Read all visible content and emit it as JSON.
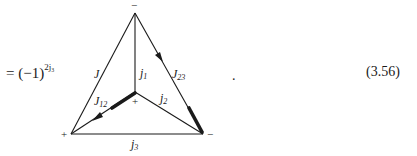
{
  "equation": {
    "lhs_prefix": "= (−1)",
    "exponent": "2j₃",
    "trailing_punctuation": ".",
    "number": "(3.56)"
  },
  "diagram": {
    "vertices": {
      "top": {
        "x": 135,
        "y": 13,
        "sign": "−"
      },
      "bottom_left": {
        "x": 71,
        "y": 134,
        "sign": "+"
      },
      "bottom_right": {
        "x": 203,
        "y": 134,
        "sign": "−"
      },
      "center": {
        "x": 135,
        "y": 92,
        "sign": "+"
      }
    },
    "edge_labels": {
      "J": {
        "main": "J",
        "sub": ""
      },
      "j1": {
        "main": "j",
        "sub": "1"
      },
      "J23": {
        "main": "J",
        "sub": "23"
      },
      "J12": {
        "main": "J",
        "sub": "12"
      },
      "j2": {
        "main": "j",
        "sub": "2"
      },
      "j3": {
        "main": "j",
        "sub": "3"
      }
    }
  }
}
